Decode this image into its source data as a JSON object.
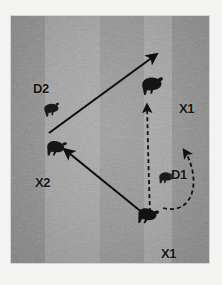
{
  "figure": {
    "type": "tactical-position-diagram",
    "medium": "photograph with drawn overlay",
    "surface": "dirt arena ground, textured, vertical light bands",
    "frame": {
      "canvas_width": 222,
      "canvas_height": 285,
      "mat_color": "#f3f3f2",
      "field_left": 11,
      "field_top": 16,
      "field_width": 198,
      "field_height": 247,
      "field_base_color": "#9c9c9c"
    },
    "bands": [
      {
        "name": "band-1",
        "x": 0,
        "width": 34,
        "color": "#8d8d8d"
      },
      {
        "name": "band-2",
        "x": 34,
        "width": 55,
        "color": "#a2a2a2"
      },
      {
        "name": "band-3",
        "x": 89,
        "width": 44,
        "color": "#939393"
      },
      {
        "name": "band-4",
        "x": 133,
        "width": 28,
        "color": "#a4a4a4"
      },
      {
        "name": "band-5",
        "x": 161,
        "width": 37,
        "color": "#8f8f8f"
      }
    ]
  },
  "labels": [
    {
      "id": "d2",
      "text": "D2",
      "x": 22,
      "y": 66,
      "role": "defender-position"
    },
    {
      "id": "x2",
      "text": "X2",
      "x": 24,
      "y": 160,
      "role": "target-position"
    },
    {
      "id": "x1_top",
      "text": "X1",
      "x": 168,
      "y": 86,
      "role": "target-position"
    },
    {
      "id": "d1",
      "text": "D1",
      "x": 160,
      "y": 152,
      "role": "defender-position"
    },
    {
      "id": "x1_bottom",
      "text": "X1",
      "x": 150,
      "y": 231,
      "role": "target-position"
    }
  ],
  "markers": [
    {
      "id": "marker-d2",
      "label": "D2",
      "x": 38,
      "y": 92,
      "size": 16,
      "rotation": -8,
      "kind": "animal-silhouette"
    },
    {
      "id": "marker-x2",
      "label": "X2",
      "x": 43,
      "y": 131,
      "size": 19,
      "rotation": 6,
      "kind": "animal-silhouette"
    },
    {
      "id": "marker-x1-top",
      "label": "X1",
      "x": 145,
      "y": 81,
      "size": 20,
      "rotation": -4,
      "kind": "animal-silhouette"
    },
    {
      "id": "marker-d1",
      "label": "D1",
      "x": 163,
      "y": 176,
      "size": 16,
      "rotation": 2,
      "kind": "animal-silhouette"
    },
    {
      "id": "marker-x1-bottom",
      "label": "X1",
      "x": 141,
      "y": 210,
      "size": 19,
      "rotation": 10,
      "kind": "animal-silhouette"
    }
  ],
  "arrows": [
    {
      "id": "arrow-x2-to-upper-right",
      "style": "solid",
      "color": "#0d0d0d",
      "width": 2.1,
      "from": {
        "x": 38,
        "y": 117
      },
      "to": {
        "x": 146,
        "y": 38
      },
      "meaning": "movement of X2 toward upper right"
    },
    {
      "id": "arrow-x1-bottom-to-x2",
      "style": "solid",
      "color": "#0d0d0d",
      "width": 2.1,
      "from": {
        "x": 138,
        "y": 202
      },
      "to": {
        "x": 53,
        "y": 133
      },
      "meaning": "movement of X1 toward X2"
    },
    {
      "id": "arrow-dashed-vertical",
      "style": "dashed",
      "color": "#111111",
      "width": 1.8,
      "dash": "4 3",
      "from": {
        "x": 139,
        "y": 196
      },
      "to": {
        "x": 136,
        "y": 89
      },
      "meaning": "intended path from lower X1 up to upper X1"
    },
    {
      "id": "arrow-dashed-curved-d1",
      "style": "dashed-curve",
      "color": "#111111",
      "width": 1.8,
      "dash": "4 3",
      "from": {
        "x": 152,
        "y": 192
      },
      "control1": {
        "x": 185,
        "y": 200
      },
      "control2": {
        "x": 190,
        "y": 160
      },
      "to": {
        "x": 173,
        "y": 134
      },
      "meaning": "curved loop path of D1 around and up"
    }
  ]
}
